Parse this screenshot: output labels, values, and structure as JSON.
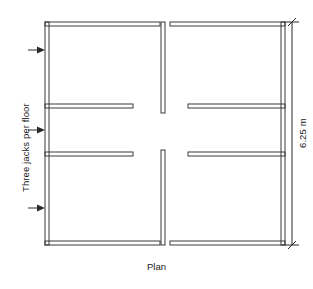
{
  "figure": {
    "caption": "Plan",
    "side_note": "Three jacks per floor",
    "dimension": "6.25 m",
    "line_color": "#3a3a3a",
    "background_color": "#ffffff"
  },
  "drawing": {
    "type": "architectural-floor-plan",
    "description": "Plan view of a four-quadrant wall layout with gaps at the centre of each wall line",
    "overall": {
      "left": 45,
      "top": 22,
      "right": 285,
      "bottom": 245,
      "wall_thickness": 4
    },
    "walls": [
      {
        "name": "left-exterior-wall",
        "orientation": "vertical",
        "x": 45,
        "y1": 22,
        "y2": 245
      },
      {
        "name": "right-exterior-wall",
        "orientation": "vertical",
        "x": 281,
        "y1": 22,
        "y2": 245
      },
      {
        "name": "top-wall-left",
        "orientation": "horizontal",
        "y": 22,
        "x1": 45,
        "x2": 160
      },
      {
        "name": "top-wall-right",
        "orientation": "horizontal",
        "y": 22,
        "x1": 170,
        "x2": 285
      },
      {
        "name": "bottom-wall-left",
        "orientation": "horizontal",
        "y": 241,
        "x1": 45,
        "x2": 160
      },
      {
        "name": "bottom-wall-right",
        "orientation": "horizontal",
        "y": 241,
        "x1": 170,
        "x2": 285
      },
      {
        "name": "centre-divider-upper",
        "orientation": "vertical",
        "x": 163,
        "y1": 22,
        "y2": 113
      },
      {
        "name": "centre-divider-lower",
        "orientation": "vertical",
        "x": 163,
        "y1": 150,
        "y2": 245
      },
      {
        "name": "inner-wall-upper-left",
        "orientation": "horizontal",
        "y": 108,
        "x1": 45,
        "x2": 133
      },
      {
        "name": "inner-wall-lower-left",
        "orientation": "horizontal",
        "y": 152,
        "x1": 45,
        "x2": 133
      },
      {
        "name": "inner-wall-upper-right",
        "orientation": "horizontal",
        "y": 108,
        "x1": 188,
        "x2": 285
      },
      {
        "name": "inner-wall-lower-right",
        "orientation": "horizontal",
        "y": 152,
        "x1": 188,
        "x2": 285
      }
    ],
    "load_arrows": [
      {
        "name": "jack-arrow-top",
        "y": 50,
        "x_tail": 28,
        "x_head": 45,
        "direction": "right"
      },
      {
        "name": "jack-arrow-middle",
        "y": 130,
        "x_tail": 28,
        "x_head": 45,
        "direction": "right"
      },
      {
        "name": "jack-arrow-bottom",
        "y": 208,
        "x_tail": 28,
        "x_head": 45,
        "direction": "right"
      }
    ],
    "dimension_line": {
      "name": "overall-height-dimension",
      "orientation": "vertical",
      "x": 292,
      "y1": 22,
      "y2": 245,
      "value": "6.25 m",
      "terminator": "architectural-slash"
    }
  }
}
